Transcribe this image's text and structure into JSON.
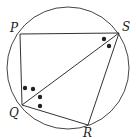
{
  "diagram": {
    "type": "cyclic-quadrilateral",
    "circle": {
      "cx": 68,
      "cy": 68,
      "r": 61
    },
    "points": {
      "P": {
        "x": 20,
        "y": 34,
        "label": "P",
        "lx": 10,
        "ly": 32
      },
      "S": {
        "x": 119,
        "y": 33,
        "label": "S",
        "lx": 122,
        "ly": 31
      },
      "Q": {
        "x": 22,
        "y": 105,
        "label": "Q",
        "lx": 9,
        "ly": 117
      },
      "R": {
        "x": 88,
        "y": 125,
        "label": "R",
        "lx": 83,
        "ly": 137
      }
    },
    "segments": [
      [
        "P",
        "S"
      ],
      [
        "P",
        "Q"
      ],
      [
        "Q",
        "S"
      ],
      [
        "Q",
        "R"
      ],
      [
        "R",
        "S"
      ]
    ],
    "angle_marks": [
      {
        "vertex": "S",
        "dots": [
          {
            "x": 104,
            "y": 39
          },
          {
            "x": 109,
            "y": 46
          }
        ]
      },
      {
        "vertex": "Q",
        "dots": [
          {
            "x": 25,
            "y": 88
          },
          {
            "x": 33,
            "y": 89
          },
          {
            "x": 40,
            "y": 97
          },
          {
            "x": 40,
            "y": 106
          }
        ]
      }
    ],
    "stroke_color": "#333333",
    "dot_color": "#222222"
  }
}
